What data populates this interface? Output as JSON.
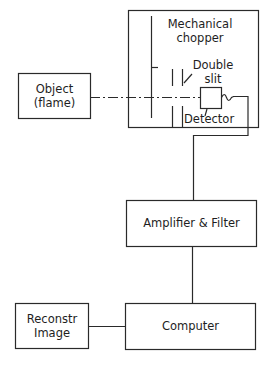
{
  "diagram": {
    "nodes": {
      "object": {
        "line1": "Object",
        "line2": "(flame)"
      },
      "chopper": {
        "line1": "Mechanical",
        "line2": "chopper"
      },
      "double_slit": {
        "line1": "Double",
        "line2": "slit"
      },
      "detector": {
        "label": "Detector"
      },
      "amplifier": {
        "label": "Amplifier & Filter"
      },
      "computer": {
        "label": "Computer"
      },
      "reconstr": {
        "line1": "Reconstr",
        "line2": "Image"
      }
    },
    "edges": [
      {
        "from": "object",
        "to": "detector",
        "style": "dash-dot optical path"
      },
      {
        "from": "detector",
        "to": "amplifier",
        "style": "solid"
      },
      {
        "from": "amplifier",
        "to": "computer",
        "style": "solid"
      },
      {
        "from": "computer",
        "to": "reconstr",
        "style": "solid"
      }
    ],
    "colors": {
      "line": "#2a2a2a",
      "background": "#ffffff"
    }
  }
}
